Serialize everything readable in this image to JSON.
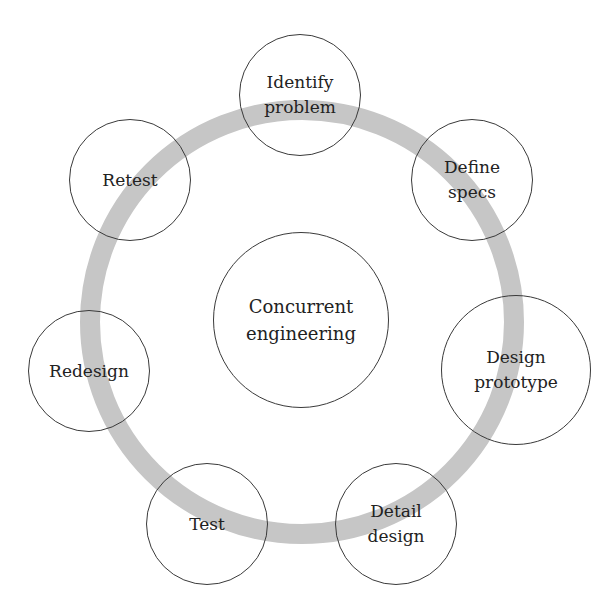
{
  "diagram": {
    "type": "cycle",
    "ring": {
      "cx": 302,
      "cy": 322,
      "r": 212,
      "stroke_width": 20,
      "color": "#c6c6c6"
    },
    "center": {
      "label": "Concurrent\nengineering",
      "cx": 301,
      "cy": 320,
      "r": 88
    },
    "nodes": [
      {
        "id": "identify-problem",
        "label": "Identify\nproblem",
        "cx": 300,
        "cy": 95,
        "r": 61
      },
      {
        "id": "define-specs",
        "label": "Define\nspecs",
        "cx": 472,
        "cy": 180,
        "r": 61
      },
      {
        "id": "design-prototype",
        "label": "Design\nprototype",
        "cx": 516,
        "cy": 370,
        "r": 75
      },
      {
        "id": "detail-design",
        "label": "Detail\ndesign",
        "cx": 396,
        "cy": 524,
        "r": 61
      },
      {
        "id": "test",
        "label": "Test",
        "cx": 207,
        "cy": 524,
        "r": 61
      },
      {
        "id": "redesign",
        "label": "Redesign",
        "cx": 89,
        "cy": 371,
        "r": 61
      },
      {
        "id": "retest",
        "label": "Retest",
        "cx": 130,
        "cy": 180,
        "r": 61
      }
    ],
    "colors": {
      "circle_stroke": "#3a3a3a",
      "text": "#222222",
      "ring": "#c6c6c6",
      "background": "#ffffff"
    }
  }
}
